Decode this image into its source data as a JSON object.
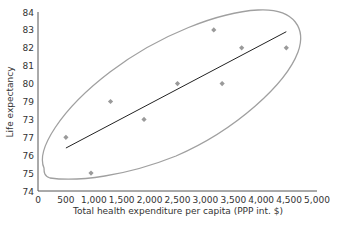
{
  "chart_data": {
    "type": "scatter",
    "title": "",
    "xlabel": "Total health expenditure per capita (PPP int. $)",
    "ylabel": "Life expectancy",
    "xlim": [
      0,
      5000
    ],
    "ylim": [
      74,
      84
    ],
    "x_ticks": [
      "0",
      "500",
      "1,000",
      "1,500",
      "2,000",
      "2,500",
      "3,000",
      "3,500",
      "4,000",
      "4,500",
      "5,000"
    ],
    "y_ticks": [
      "74",
      "75",
      "76",
      "77",
      "73",
      "79",
      "80",
      "81",
      "82",
      "83",
      "84"
    ],
    "grid": false,
    "legend": null,
    "series": [
      {
        "name": "Countries",
        "marker": "diamond",
        "color": "#9a9a9a",
        "points": [
          {
            "x": 500,
            "y": 77
          },
          {
            "x": 950,
            "y": 75
          },
          {
            "x": 1300,
            "y": 79
          },
          {
            "x": 1900,
            "y": 78
          },
          {
            "x": 2500,
            "y": 80
          },
          {
            "x": 3150,
            "y": 83
          },
          {
            "x": 3300,
            "y": 80
          },
          {
            "x": 3650,
            "y": 82
          },
          {
            "x": 4450,
            "y": 82
          }
        ]
      }
    ],
    "trendline": {
      "color": "#222222",
      "start": {
        "x": 500,
        "y": 76.4
      },
      "end": {
        "x": 4450,
        "y": 82.9
      }
    },
    "annotations": [
      {
        "type": "enclosing-outline",
        "color": "#9a9a9a",
        "description": "hand-drawn ellipse enclosing all data points"
      }
    ]
  },
  "colors": {
    "axis": "#555555",
    "marker": "#9a9a9a",
    "trendline": "#222222",
    "outline": "#a0a0a0"
  }
}
